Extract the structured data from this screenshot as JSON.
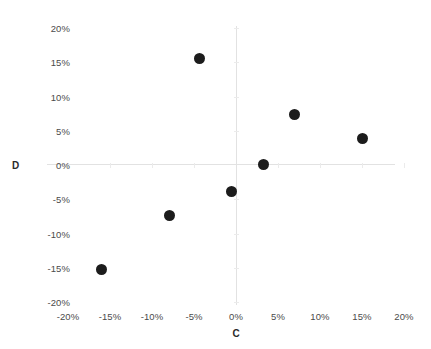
{
  "chart_data": {
    "type": "scatter",
    "title": "",
    "xlabel": "C",
    "ylabel": "D",
    "xlim": [
      -20,
      20
    ],
    "ylim": [
      -20,
      20
    ],
    "grid": false,
    "legend": "none",
    "x_ticks": [
      "-20%",
      "-15%",
      "-10%",
      "-5%",
      "0%",
      "5%",
      "10%",
      "15%",
      "20%"
    ],
    "x_tick_values": [
      -20,
      -15,
      -10,
      -5,
      0,
      5,
      10,
      15,
      20
    ],
    "y_ticks": [
      "20%",
      "15%",
      "10%",
      "5%",
      "0%",
      "-5%",
      "-10%",
      "-15%",
      "-20%"
    ],
    "y_tick_values": [
      20,
      15,
      10,
      5,
      0,
      -5,
      -10,
      -15,
      -20
    ],
    "marker_color": "#1c1c1c",
    "marker_size": 11,
    "axis_color": "#e2e2e2",
    "points": [
      {
        "x": -4.3,
        "y": 15.5
      },
      {
        "x": 7.0,
        "y": 7.4
      },
      {
        "x": 15.1,
        "y": 3.9
      },
      {
        "x": 3.3,
        "y": 0.1
      },
      {
        "x": -0.5,
        "y": -3.9
      },
      {
        "x": -7.9,
        "y": -7.4
      },
      {
        "x": -16.0,
        "y": -15.3
      }
    ],
    "series": [
      {
        "name": "",
        "x": [
          -4.3,
          7.0,
          15.1,
          3.3,
          -0.5,
          -7.9,
          -16.0
        ],
        "values": [
          15.5,
          7.4,
          3.9,
          0.1,
          -3.9,
          -7.4,
          -15.3
        ]
      }
    ]
  }
}
